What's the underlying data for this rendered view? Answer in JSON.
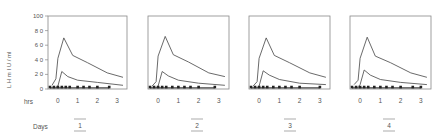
{
  "chart_data": {
    "type": "line",
    "title": "",
    "ylabel": "L H m I U / ml",
    "xlabel": "hrs",
    "ylim": [
      0,
      100
    ],
    "xlim": [
      -0.5,
      3.5
    ],
    "yticks": [
      "0",
      "2 0",
      "4 0",
      "6 0",
      "8 0",
      "100"
    ],
    "ytick_values": [
      0,
      20,
      40,
      60,
      80,
      100
    ],
    "xticks": [
      "0",
      "1",
      "2",
      "3"
    ],
    "xtick_values": [
      0,
      1,
      2,
      3
    ],
    "grid": false,
    "legend": null,
    "bottom_label": "Days",
    "panels": [
      {
        "day": "1",
        "series": [
          {
            "name": "upper",
            "x": [
              -0.3,
              -0.1,
              0.0,
              0.3,
              0.75,
              1.5,
              2.5,
              3.3
            ],
            "y": [
              5,
              14,
              42,
              70,
              46,
              36,
              22,
              16
            ]
          },
          {
            "name": "lower",
            "x": [
              -0.1,
              0.0,
              0.2,
              0.5,
              1.0,
              2.0,
              3.3
            ],
            "y": [
              2,
              4,
              24,
              17,
              12,
              9,
              5
            ]
          },
          {
            "name": "baseline",
            "x": [
              -0.4,
              -0.2,
              0.0,
              0.2,
              0.4,
              0.6,
              1.0,
              1.3,
              1.6,
              2.0,
              2.6
            ],
            "y": [
              2,
              2,
              2,
              2,
              2,
              2,
              2,
              2,
              2,
              2,
              2
            ]
          }
        ]
      },
      {
        "day": "2",
        "series": [
          {
            "name": "upper",
            "x": [
              -0.3,
              -0.1,
              0.0,
              0.35,
              0.75,
              1.5,
              2.5,
              3.3
            ],
            "y": [
              4,
              10,
              45,
              72,
              47,
              37,
              22,
              17
            ]
          },
          {
            "name": "lower",
            "x": [
              -0.1,
              0.0,
              0.2,
              0.5,
              1.0,
              2.0,
              3.3
            ],
            "y": [
              2,
              4,
              24,
              18,
              12,
              8,
              5
            ]
          },
          {
            "name": "baseline",
            "x": [
              -0.4,
              -0.2,
              0.0,
              0.2,
              0.4,
              0.7,
              1.0,
              1.3,
              1.6,
              2.0,
              2.8
            ],
            "y": [
              2,
              2,
              2,
              2,
              2,
              2,
              2,
              2,
              2,
              2,
              2
            ]
          }
        ]
      },
      {
        "day": "3",
        "series": [
          {
            "name": "upper",
            "x": [
              -0.3,
              -0.1,
              0.0,
              0.35,
              0.75,
              1.5,
              2.5,
              3.3
            ],
            "y": [
              4,
              10,
              42,
              70,
              46,
              36,
              22,
              16
            ]
          },
          {
            "name": "lower",
            "x": [
              -0.1,
              0.0,
              0.2,
              0.5,
              1.0,
              2.0,
              3.3
            ],
            "y": [
              2,
              4,
              25,
              19,
              13,
              8,
              6
            ]
          },
          {
            "name": "baseline",
            "x": [
              -0.4,
              -0.2,
              0.0,
              0.2,
              0.4,
              0.7,
              1.0,
              1.3,
              1.6,
              2.0,
              3.0
            ],
            "y": [
              2,
              2,
              2,
              2,
              2,
              2,
              2,
              2,
              2,
              2,
              2
            ]
          }
        ]
      },
      {
        "day": "4",
        "series": [
          {
            "name": "upper",
            "x": [
              -0.3,
              -0.1,
              0.0,
              0.35,
              0.75,
              1.5,
              2.5,
              3.3
            ],
            "y": [
              6,
              12,
              42,
              71,
              45,
              36,
              22,
              16
            ]
          },
          {
            "name": "lower",
            "x": [
              -0.1,
              0.0,
              0.2,
              0.5,
              1.0,
              2.0,
              3.3
            ],
            "y": [
              3,
              6,
              26,
              19,
              13,
              9,
              6
            ]
          },
          {
            "name": "baseline",
            "x": [
              -0.4,
              -0.2,
              0.0,
              0.2,
              0.4,
              0.7,
              1.0,
              1.3,
              1.6,
              2.0,
              2.6,
              3.0
            ],
            "y": [
              2,
              2,
              2,
              2,
              2,
              2,
              2,
              2,
              2,
              2,
              2,
              2
            ]
          }
        ]
      }
    ]
  },
  "labels": {
    "ylabel": "L H m I U / ml",
    "hrs": "hrs",
    "days": "Days"
  },
  "colors": {
    "line": "#444444",
    "frame": "#888888",
    "text": "#555555"
  }
}
